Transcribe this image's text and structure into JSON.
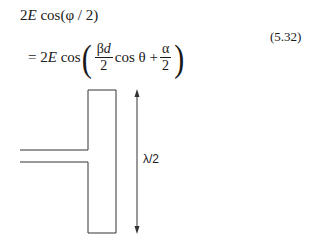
{
  "equation": {
    "line1": {
      "coef": "2",
      "var": "E",
      "func": "cos",
      "arg": "(φ / 2)"
    },
    "line2": {
      "prefix": "= 2",
      "var": "E",
      "func": "cos",
      "frac1_num_greek": "β",
      "frac1_num_var": "d",
      "frac1_den": "2",
      "mid": "cos θ +",
      "frac2_num": "α",
      "frac2_den": "2"
    },
    "number": "(5.32)"
  },
  "figure": {
    "dimension_label": "λ/2",
    "stroke_color": "#333333"
  }
}
